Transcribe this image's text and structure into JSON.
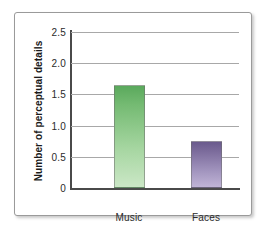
{
  "chart_data": {
    "type": "bar",
    "title": "",
    "xlabel": "",
    "ylabel": "Number of perceptual details",
    "categories": [
      "Music",
      "Faces"
    ],
    "values": [
      1.65,
      0.75
    ],
    "series": [
      {
        "name": "Number of perceptual details",
        "values": [
          1.65,
          0.75
        ]
      }
    ],
    "ylim": [
      0,
      2.5
    ],
    "yticks": [
      "0",
      "0.5",
      "1.0",
      "1.5",
      "2.0",
      "2.5"
    ],
    "ytick_values": [
      0,
      0.5,
      1.0,
      1.5,
      2.0,
      2.5
    ],
    "grid": "horizontal",
    "legend": "none",
    "bar_colors": [
      "#5aa95c",
      "#6a5a8d"
    ],
    "bar_colors_bottom": [
      "#cbe7c6",
      "#c0b4d6"
    ],
    "annotations": []
  },
  "axis": {
    "ticks": [
      {
        "label": "2.5",
        "value": 2.5
      },
      {
        "label": "2.0",
        "value": 2.0
      },
      {
        "label": "1.5",
        "value": 1.5
      },
      {
        "label": "1.0",
        "value": 1.0
      },
      {
        "label": "0.5",
        "value": 0.5
      },
      {
        "label": "0",
        "value": 0
      }
    ],
    "y_title": "Number of perceptual details"
  },
  "bars": [
    {
      "label": "Music",
      "value": 1.65
    },
    {
      "label": "Faces",
      "value": 0.75
    }
  ]
}
